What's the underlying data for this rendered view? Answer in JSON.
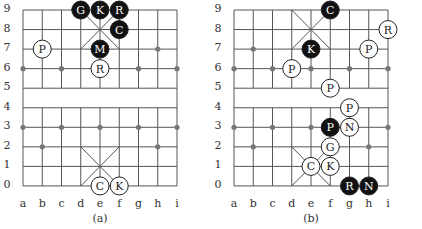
{
  "boards": [
    {
      "id": "a",
      "caption": "(a)",
      "files": [
        "a",
        "b",
        "c",
        "d",
        "e",
        "f",
        "g",
        "h",
        "i"
      ],
      "ranks": [
        "9",
        "8",
        "7",
        "6",
        "5",
        "4",
        "3",
        "2",
        "1",
        "0"
      ],
      "markers": [
        [
          1,
          7
        ],
        [
          7,
          7
        ],
        [
          0,
          6
        ],
        [
          2,
          6
        ],
        [
          6,
          6
        ],
        [
          8,
          6
        ],
        [
          0,
          3
        ],
        [
          2,
          3
        ],
        [
          4,
          3
        ],
        [
          6,
          3
        ],
        [
          8,
          3
        ],
        [
          1,
          2
        ],
        [
          7,
          2
        ]
      ],
      "pieces": [
        {
          "label": "G",
          "side": "black",
          "file": 3,
          "rank": 9
        },
        {
          "label": "K",
          "side": "black",
          "file": 4,
          "rank": 9
        },
        {
          "label": "R",
          "side": "black",
          "file": 5,
          "rank": 9
        },
        {
          "label": "C",
          "side": "black",
          "file": 5,
          "rank": 8
        },
        {
          "label": "M",
          "side": "black",
          "file": 4,
          "rank": 7
        },
        {
          "label": "P",
          "side": "white",
          "file": 1,
          "rank": 7
        },
        {
          "label": "R",
          "side": "white",
          "file": 4,
          "rank": 6
        },
        {
          "label": "C",
          "side": "white",
          "file": 4,
          "rank": 0
        },
        {
          "label": "K",
          "side": "white",
          "file": 5,
          "rank": 0
        }
      ]
    },
    {
      "id": "b",
      "caption": "(b)",
      "files": [
        "a",
        "b",
        "c",
        "d",
        "e",
        "f",
        "g",
        "h",
        "i"
      ],
      "ranks": [
        "9",
        "8",
        "7",
        "6",
        "5",
        "4",
        "3",
        "2",
        "1",
        "0"
      ],
      "markers": [
        [
          1,
          7
        ],
        [
          0,
          6
        ],
        [
          2,
          6
        ],
        [
          4,
          6
        ],
        [
          6,
          6
        ],
        [
          8,
          6
        ],
        [
          0,
          3
        ],
        [
          2,
          3
        ],
        [
          4,
          3
        ],
        [
          8,
          3
        ],
        [
          1,
          2
        ],
        [
          7,
          2
        ]
      ],
      "pieces": [
        {
          "label": "C",
          "side": "black",
          "file": 5,
          "rank": 9
        },
        {
          "label": "R",
          "side": "white",
          "file": 8,
          "rank": 8
        },
        {
          "label": "K",
          "side": "black",
          "file": 4,
          "rank": 7
        },
        {
          "label": "P",
          "side": "white",
          "file": 7,
          "rank": 7
        },
        {
          "label": "P",
          "side": "white",
          "file": 3,
          "rank": 6
        },
        {
          "label": "P",
          "side": "white",
          "file": 5,
          "rank": 5
        },
        {
          "label": "P",
          "side": "white",
          "file": 6,
          "rank": 4
        },
        {
          "label": "P",
          "side": "black",
          "file": 5,
          "rank": 3
        },
        {
          "label": "N",
          "side": "white",
          "file": 6,
          "rank": 3
        },
        {
          "label": "G",
          "side": "white",
          "file": 5,
          "rank": 2
        },
        {
          "label": "C",
          "side": "white",
          "file": 4,
          "rank": 1
        },
        {
          "label": "K",
          "side": "white",
          "file": 5,
          "rank": 1
        },
        {
          "label": "R",
          "side": "black",
          "file": 6,
          "rank": 0
        },
        {
          "label": "N",
          "side": "black",
          "file": 7,
          "rank": 0
        }
      ]
    }
  ],
  "colors": {
    "line": "#555555",
    "marker": "#777777",
    "black_piece": "#111111",
    "white_piece": "#ffffff"
  }
}
